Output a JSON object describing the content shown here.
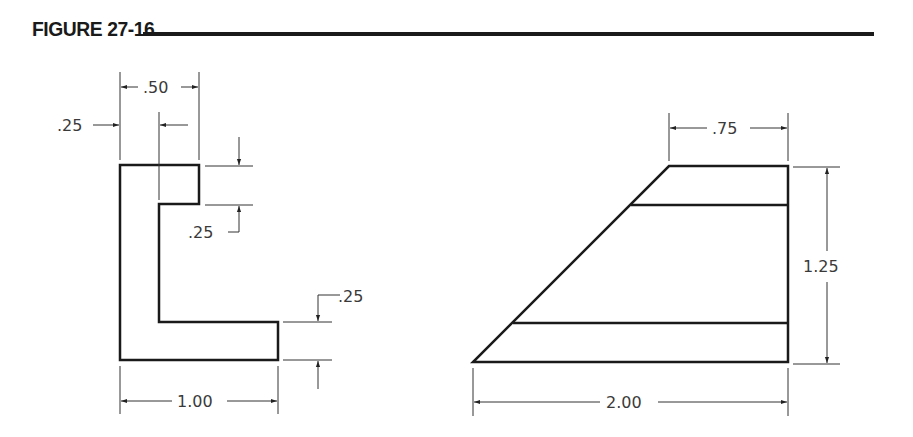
{
  "figure": {
    "title": "FIGURE 27-16"
  },
  "left_view": {
    "dimensions": {
      "top_width": ".50",
      "inner_offset": ".25",
      "top_thickness": ".25",
      "bottom_thickness": ".25",
      "overall_width": "1.00"
    }
  },
  "right_view": {
    "dimensions": {
      "top_width": ".75",
      "height": "1.25",
      "overall_width": "2.00"
    }
  },
  "colors": {
    "line": "#1a1a1a",
    "dim_line": "#333333",
    "text": "#3a3a3a"
  }
}
